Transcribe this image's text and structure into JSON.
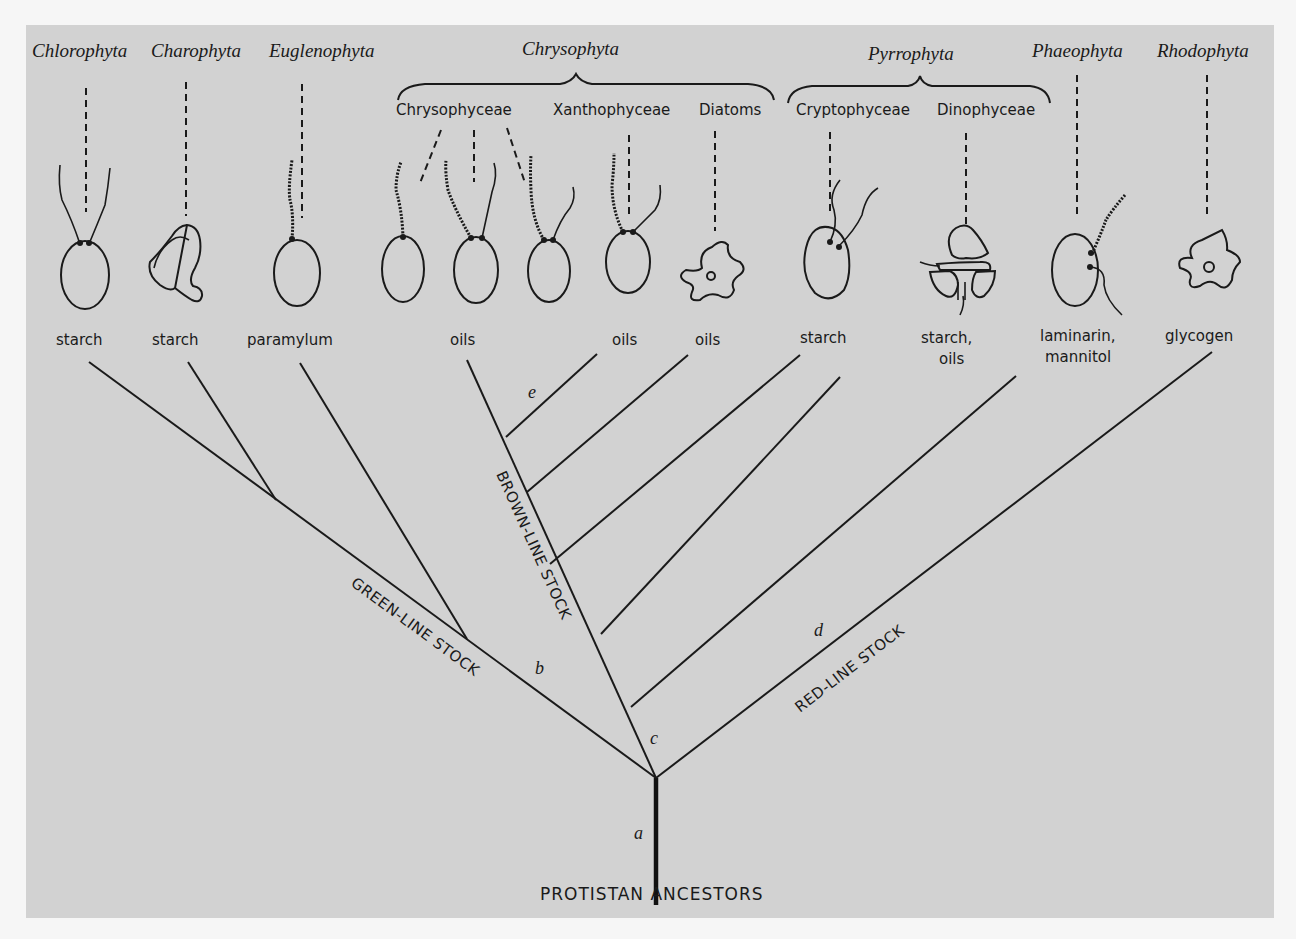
{
  "diagram": {
    "root_label": "PROTISTAN ANCESTORS",
    "stocks": {
      "green": "GREEN-LINE STOCK",
      "brown": "BROWN-LINE STOCK",
      "red": "RED-LINE STOCK"
    },
    "node_labels": {
      "a": "a",
      "b": "b",
      "c": "c",
      "d": "d",
      "e": "e"
    },
    "groups": {
      "chrysophyta": {
        "name": "Chrysophyta",
        "classes": [
          "Chrysophyceae",
          "Xanthophyceae",
          "Diatoms"
        ]
      },
      "pyrrophyta": {
        "name": "Pyrrophyta",
        "classes": [
          "Cryptophyceae",
          "Dinophyceae"
        ]
      }
    },
    "phyla": {
      "chlorophyta": "Chlorophyta",
      "charophyta": "Charophyta",
      "euglenophyta": "Euglenophyta",
      "chrysophyta": "Chrysophyta",
      "pyrrophyta": "Pyrrophyta",
      "phaeophyta": "Phaeophyta",
      "rhodophyta": "Rhodophyta"
    },
    "classes": {
      "chrysophyceae": "Chrysophyceae",
      "xanthophyceae": "Xanthophyceae",
      "diatoms": "Diatoms",
      "cryptophyceae": "Cryptophyceae",
      "dinophyceae": "Dinophyceae"
    },
    "storage_products": {
      "chlorophyta": "starch",
      "charophyta": "starch",
      "euglenophyta": "paramylum",
      "chrysophyceae": "oils",
      "xanthophyceae": "oils",
      "diatoms": "oils",
      "cryptophyceae": "starch",
      "dinophyceae_line1": "starch,",
      "dinophyceae_line2": "oils",
      "phaeophyta_line1": "laminarin,",
      "phaeophyta_line2": "mannitol",
      "rhodophyta": "glycogen"
    }
  }
}
